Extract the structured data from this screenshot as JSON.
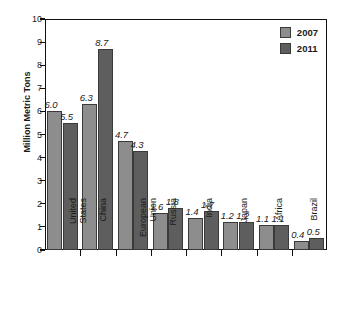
{
  "chart_data": {
    "type": "bar",
    "title": "",
    "xlabel": "",
    "ylabel": "Million Metric Tons",
    "ylim": [
      0,
      10
    ],
    "ytick_labels": [
      "10",
      "9",
      "8",
      "7",
      "6",
      "5",
      "4",
      "3",
      "2",
      "1",
      "0"
    ],
    "ytick_values": [
      10,
      9,
      8,
      7,
      6,
      5,
      4,
      3,
      2,
      1,
      0
    ],
    "grid": false,
    "legend_position": "top-right-inside",
    "categories": [
      "United States",
      "China",
      "European Union",
      "Russia",
      "India",
      "Japan",
      "Africa",
      "Brazil"
    ],
    "category_lines": [
      [
        "United",
        "States"
      ],
      [
        "China",
        ""
      ],
      [
        "European",
        "Union"
      ],
      [
        "Russia",
        ""
      ],
      [
        "India",
        ""
      ],
      [
        "Japan",
        ""
      ],
      [
        "Africa",
        ""
      ],
      [
        "Brazil",
        ""
      ]
    ],
    "series": [
      {
        "name": "2007",
        "color": "#8d8d8d",
        "values": [
          6.0,
          6.3,
          4.7,
          1.6,
          1.4,
          1.2,
          1.1,
          0.4
        ],
        "labels": [
          "6.0",
          "6.3",
          "4.7",
          "1.6",
          "1.4",
          "1.2",
          "1.1",
          "0.4"
        ]
      },
      {
        "name": "2011",
        "color": "#5e5e5e",
        "values": [
          5.5,
          8.7,
          4.3,
          1.8,
          1.7,
          1.2,
          1.1,
          0.5
        ],
        "labels": [
          "5.5",
          "8.7",
          "4.3",
          "1.8",
          "1.7",
          "1.2",
          "1.1",
          "0.5"
        ]
      }
    ]
  },
  "legend": {
    "items": [
      {
        "label": "2007",
        "color": "#8d8d8d"
      },
      {
        "label": "2011",
        "color": "#5e5e5e"
      }
    ]
  }
}
